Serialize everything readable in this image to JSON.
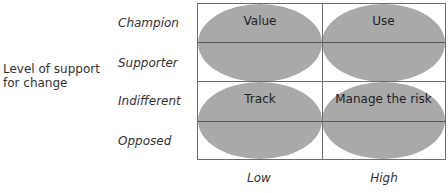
{
  "diagram": {
    "y_axis_title": "Level of support for change",
    "y_axis_title_lines": [
      "Level of support",
      "for change"
    ],
    "row_labels": [
      "Champion",
      "Supporter",
      "Indifferent",
      "Opposed"
    ],
    "col_labels": [
      "Low",
      "High"
    ],
    "quadrants": [
      {
        "label": "Value",
        "position": "top-left"
      },
      {
        "label": "Use",
        "position": "top-right"
      },
      {
        "label": "Track",
        "position": "bottom-left"
      },
      {
        "label": "Manage the risk",
        "position": "bottom-right"
      }
    ],
    "colors": {
      "ellipse_fill": "#a9a9a9",
      "grid_line": "#6e6e6e",
      "text": "#2a2a2a"
    }
  }
}
